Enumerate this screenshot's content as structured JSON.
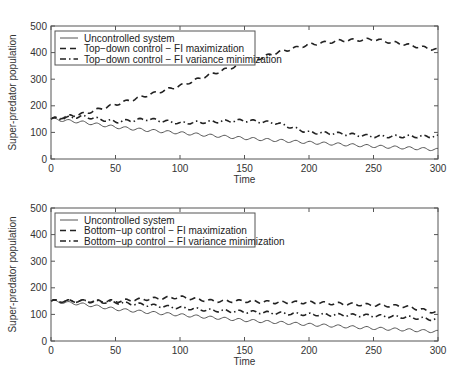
{
  "chart_data": [
    {
      "type": "line",
      "title": "",
      "xlabel": "Time",
      "ylabel": "Super-predator population",
      "xlim": [
        0,
        300
      ],
      "ylim": [
        0,
        500
      ],
      "xticks": [
        0,
        50,
        100,
        150,
        200,
        250,
        300
      ],
      "yticks": [
        0,
        100,
        200,
        300,
        400,
        500
      ],
      "grid": false,
      "legend_position": "upper left",
      "x": [
        0,
        25,
        50,
        75,
        100,
        125,
        150,
        175,
        200,
        225,
        250,
        275,
        300
      ],
      "series": [
        {
          "name": "Uncontrolled system",
          "style": "solid",
          "values": [
            150,
            138,
            120,
            108,
            98,
            88,
            78,
            70,
            62,
            55,
            48,
            42,
            35
          ]
        },
        {
          "name": "Top-down control - FI maximization",
          "style": "dashed",
          "values": [
            150,
            170,
            205,
            240,
            275,
            320,
            360,
            400,
            430,
            445,
            450,
            430,
            410
          ]
        },
        {
          "name": "Top-down control - FI variance minimization",
          "style": "dash-dot",
          "values": [
            150,
            160,
            140,
            150,
            135,
            140,
            145,
            135,
            100,
            95,
            85,
            85,
            85
          ]
        }
      ]
    },
    {
      "type": "line",
      "title": "",
      "xlabel": "Time",
      "ylabel": "Super-predator population",
      "xlim": [
        0,
        300
      ],
      "ylim": [
        0,
        500
      ],
      "xticks": [
        0,
        50,
        100,
        150,
        200,
        250,
        300
      ],
      "yticks": [
        0,
        100,
        200,
        300,
        400,
        500
      ],
      "grid": false,
      "legend_position": "upper left",
      "x": [
        0,
        25,
        50,
        75,
        100,
        125,
        150,
        175,
        200,
        225,
        250,
        275,
        300
      ],
      "series": [
        {
          "name": "Uncontrolled system",
          "style": "solid",
          "values": [
            150,
            138,
            120,
            108,
            98,
            88,
            78,
            70,
            62,
            55,
            48,
            42,
            35
          ]
        },
        {
          "name": "Bottom-up control - FI maximization",
          "style": "dashed",
          "values": [
            150,
            150,
            150,
            158,
            165,
            150,
            150,
            145,
            145,
            140,
            135,
            130,
            105
          ]
        },
        {
          "name": "Bottom-up control - FI variance minimization",
          "style": "dash-dot",
          "values": [
            150,
            150,
            145,
            135,
            125,
            115,
            110,
            105,
            100,
            98,
            95,
            90,
            80
          ]
        }
      ]
    }
  ],
  "plots": [
    {
      "ylabel": "Super-predator population",
      "xlabel": "Time",
      "yticks": [
        "0",
        "100",
        "200",
        "300",
        "400",
        "500"
      ],
      "xticks": [
        "0",
        "50",
        "100",
        "150",
        "200",
        "250",
        "300"
      ],
      "legend": [
        "Uncontrolled system",
        "Top−down control − FI maximization",
        "Top−down control − FI variance minimization"
      ]
    },
    {
      "ylabel": "Super-predator population",
      "xlabel": "Time",
      "yticks": [
        "0",
        "100",
        "200",
        "300",
        "400",
        "500"
      ],
      "xticks": [
        "0",
        "50",
        "100",
        "150",
        "200",
        "250",
        "300"
      ],
      "legend": [
        "Uncontrolled system",
        "Bottom−up control − FI maximization",
        "Bottom−up control − FI variance minimization"
      ]
    }
  ],
  "colors": {
    "axis": "#555555",
    "line": "#222222",
    "uncontrolled": "#555555"
  }
}
